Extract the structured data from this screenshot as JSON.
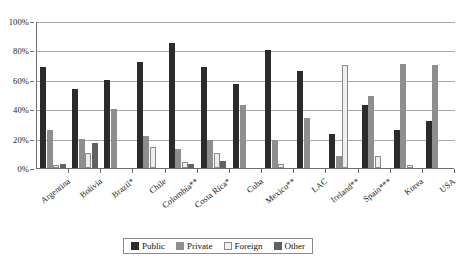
{
  "chart_data": {
    "type": "bar",
    "title": "",
    "subtitle": "",
    "xlabel": "",
    "ylabel": "",
    "ylim": [
      0,
      100
    ],
    "y_ticks": [
      0,
      20,
      40,
      60,
      80,
      100
    ],
    "y_tick_labels": [
      "0%",
      "20%",
      "40%",
      "60%",
      "80%",
      "100%"
    ],
    "grid": true,
    "legend_position": "bottom",
    "categories": [
      "Argentina",
      "Bolivia",
      "Brazil*",
      "Chile",
      "Colombia**",
      "Costa Rica*",
      "Cuba",
      "Mexico**",
      "LAC",
      "Ireland**",
      "Spain***",
      "Korea",
      "USA"
    ],
    "series": [
      {
        "name": "Public",
        "color": "#2b2b2b",
        "values": [
          69,
          54,
          60,
          72,
          85,
          69,
          57,
          80,
          66,
          23,
          43,
          26,
          32
        ]
      },
      {
        "name": "Private",
        "color": "#8e8e8e",
        "values": [
          26,
          20,
          40,
          22,
          13,
          19,
          43,
          19,
          34,
          8,
          49,
          71,
          70
        ]
      },
      {
        "name": "Foreign",
        "color": "#eeeeee",
        "values": [
          2,
          10,
          0,
          14,
          4,
          10,
          0,
          3,
          0,
          70,
          8,
          2,
          0
        ]
      },
      {
        "name": "Other",
        "color": "#616161",
        "values": [
          3,
          17,
          0,
          0,
          3,
          5,
          0,
          0,
          0,
          0,
          0,
          0,
          0
        ]
      }
    ]
  },
  "legend": {
    "items": [
      {
        "label": "Public",
        "key": "public"
      },
      {
        "label": "Private",
        "key": "private"
      },
      {
        "label": "Foreign",
        "key": "foreign"
      },
      {
        "label": "Other",
        "key": "other"
      }
    ]
  }
}
